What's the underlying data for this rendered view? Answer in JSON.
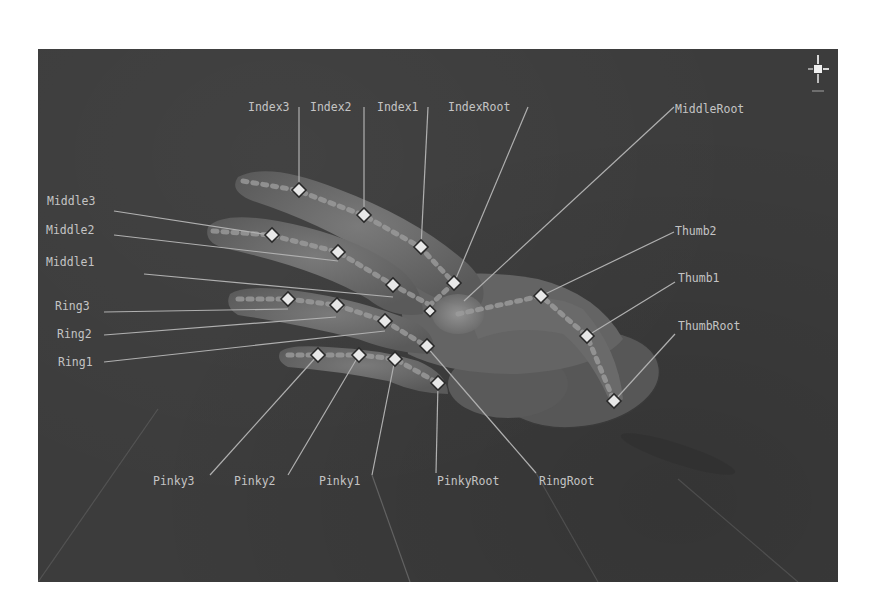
{
  "viewport": {
    "background": "#3c3c3c",
    "label_color": "#c4c4c4",
    "marker_color": "#e8e8e8"
  },
  "gizmo": {
    "icon": "view-orientation-gizmo-icon"
  },
  "labels": {
    "index3": "Index3",
    "index2": "Index2",
    "index1": "Index1",
    "index_root": "IndexRoot",
    "middle_root": "MiddleRoot",
    "middle3": "Middle3",
    "middle2": "Middle2",
    "middle1": "Middle1",
    "ring3": "Ring3",
    "ring2": "Ring2",
    "ring1": "Ring1",
    "thumb2": "Thumb2",
    "thumb1": "Thumb1",
    "thumb_root": "ThumbRoot",
    "pinky3": "Pinky3",
    "pinky2": "Pinky2",
    "pinky1": "Pinky1",
    "pinky_root": "PinkyRoot",
    "ring_root": "RingRoot"
  }
}
